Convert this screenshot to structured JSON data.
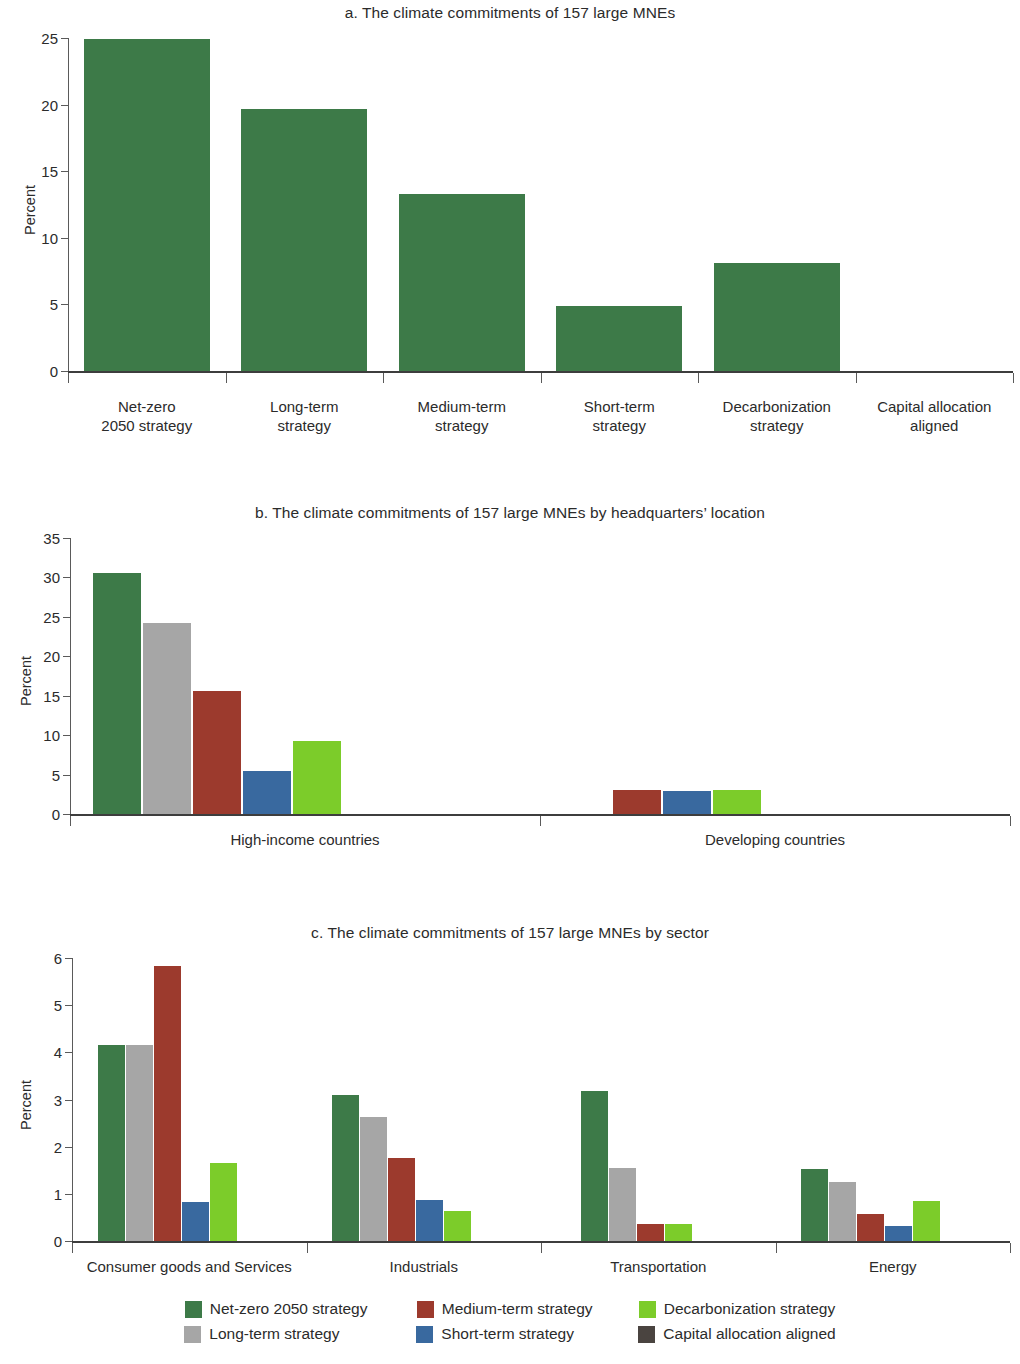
{
  "ylabel_text": "Percent",
  "colors": {
    "net_zero": "#3d7a48",
    "long_term": "#a6a6a6",
    "medium_term": "#9c3a2d",
    "short_term": "#39699f",
    "decarbonization": "#7ccc2a",
    "capital_allocation": "#4a4440"
  },
  "legend": {
    "rows": [
      [
        {
          "label": "Net-zero 2050 strategy",
          "color_key": "net_zero",
          "swatch": "net-zero-swatch"
        },
        {
          "label": "Medium-term strategy",
          "color_key": "medium_term",
          "swatch": "medium-term-swatch"
        },
        {
          "label": "Decarbonization strategy",
          "color_key": "decarbonization",
          "swatch": "decarbonization-swatch"
        }
      ],
      [
        {
          "label": "Long-term strategy",
          "color_key": "long_term",
          "swatch": "long-term-swatch"
        },
        {
          "label": "Short-term strategy",
          "color_key": "short_term",
          "swatch": "short-term-swatch"
        },
        {
          "label": "Capital allocation aligned",
          "color_key": "capital_allocation",
          "swatch": "capital-allocation-swatch"
        }
      ]
    ]
  },
  "chart_data": [
    {
      "id": "panel-a",
      "type": "bar",
      "title": "a. The climate commitments of 157 large MNEs",
      "xlabel": "",
      "ylabel": "Percent",
      "ylim": [
        0,
        25
      ],
      "yticks": [
        0,
        5,
        10,
        15,
        20,
        25
      ],
      "grid": false,
      "legend_position": "none",
      "categories": [
        "Net-zero\n2050 strategy",
        "Long-term\nstrategy",
        "Medium-term\nstrategy",
        "Short-term\nstrategy",
        "Decarbonization\nstrategy",
        "Capital allocation\naligned"
      ],
      "category_lines": [
        [
          "Net-zero",
          "2050 strategy"
        ],
        [
          "Long-term",
          "strategy"
        ],
        [
          "Medium-term",
          "strategy"
        ],
        [
          "Short-term",
          "strategy"
        ],
        [
          "Decarbonization",
          "strategy"
        ],
        [
          "Capital allocation",
          "aligned"
        ]
      ],
      "series": [
        {
          "name": "All MNEs",
          "color_key": "net_zero",
          "values": [
            24.9,
            19.7,
            13.3,
            4.9,
            8.1,
            0.0
          ]
        }
      ]
    },
    {
      "id": "panel-b",
      "type": "bar",
      "title": "b. The climate commitments of 157 large MNEs by headquarters’ location",
      "xlabel": "",
      "ylabel": "Percent",
      "ylim": [
        0,
        35
      ],
      "yticks": [
        0,
        5,
        10,
        15,
        20,
        25,
        30,
        35
      ],
      "grid": false,
      "legend_position": "bottom",
      "categories": [
        "High-income countries",
        "Developing countries"
      ],
      "series": [
        {
          "name": "Net-zero 2050 strategy",
          "color_key": "net_zero",
          "values": [
            30.5,
            0.0
          ]
        },
        {
          "name": "Long-term strategy",
          "color_key": "long_term",
          "values": [
            24.2,
            0.0
          ]
        },
        {
          "name": "Medium-term strategy",
          "color_key": "medium_term",
          "values": [
            15.6,
            3.0
          ]
        },
        {
          "name": "Short-term strategy",
          "color_key": "short_term",
          "values": [
            5.4,
            2.9
          ]
        },
        {
          "name": "Decarbonization strategy",
          "color_key": "decarbonization",
          "values": [
            9.2,
            3.0
          ]
        },
        {
          "name": "Capital allocation aligned",
          "color_key": "capital_allocation",
          "values": [
            0.0,
            0.0
          ]
        }
      ]
    },
    {
      "id": "panel-c",
      "type": "bar",
      "title": "c. The climate commitments of 157 large MNEs by sector",
      "xlabel": "",
      "ylabel": "Percent",
      "ylim": [
        0,
        6
      ],
      "yticks": [
        0,
        1,
        2,
        3,
        4,
        5,
        6
      ],
      "grid": false,
      "legend_position": "bottom",
      "categories": [
        "Consumer goods and Services",
        "Industrials",
        "Transportation",
        "Energy"
      ],
      "series": [
        {
          "name": "Net-zero 2050 strategy",
          "color_key": "net_zero",
          "values": [
            4.15,
            3.1,
            3.17,
            1.53
          ]
        },
        {
          "name": "Long-term strategy",
          "color_key": "long_term",
          "values": [
            4.15,
            2.63,
            1.55,
            1.25
          ]
        },
        {
          "name": "Medium-term strategy",
          "color_key": "medium_term",
          "values": [
            5.83,
            1.75,
            0.35,
            0.58
          ]
        },
        {
          "name": "Short-term strategy",
          "color_key": "short_term",
          "values": [
            0.82,
            0.87,
            0.0,
            0.32
          ]
        },
        {
          "name": "Decarbonization strategy",
          "color_key": "decarbonization",
          "values": [
            1.65,
            0.63,
            0.35,
            0.85
          ]
        },
        {
          "name": "Capital allocation aligned",
          "color_key": "capital_allocation",
          "values": [
            0.0,
            0.0,
            0.0,
            0.0
          ]
        }
      ]
    }
  ]
}
